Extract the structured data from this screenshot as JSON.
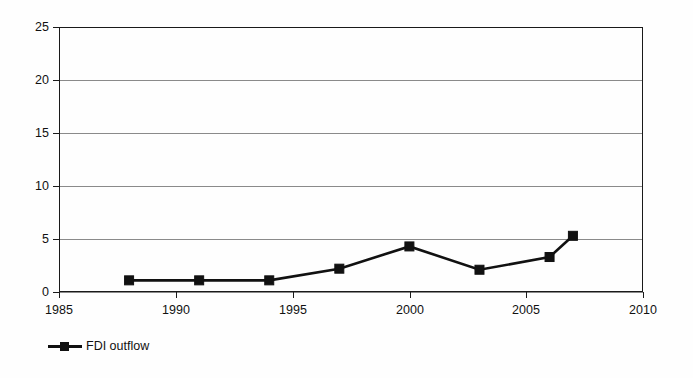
{
  "chart_data": {
    "type": "line",
    "title": "",
    "subtitle": "",
    "xlabel": "",
    "ylabel": "",
    "x": [
      1988,
      1991,
      1994,
      1997,
      2000,
      2003,
      2006,
      2007
    ],
    "values": [
      1.1,
      1.1,
      1.1,
      2.2,
      4.3,
      2.1,
      3.3,
      5.3
    ],
    "series": [
      {
        "name": "FDI outflow",
        "x": [
          1988,
          1991,
          1994,
          1997,
          2000,
          2003,
          2006,
          2007
        ],
        "values": [
          1.1,
          1.1,
          1.1,
          2.2,
          4.3,
          2.1,
          3.3,
          5.3
        ],
        "color": "#111111",
        "marker": "square"
      }
    ],
    "xlim": [
      1985,
      2010
    ],
    "ylim": [
      0,
      25
    ],
    "xticks": [
      1985,
      1990,
      1995,
      2000,
      2005,
      2010
    ],
    "yticks": [
      0,
      5,
      10,
      15,
      20,
      25
    ],
    "xtick_labels": [
      "1985",
      "1990",
      "1995",
      "2000",
      "2005",
      "2010"
    ],
    "ytick_labels": [
      "0",
      "5",
      "10",
      "15",
      "20",
      "25"
    ],
    "grid": "horizontal",
    "legend_position": "bottom-left",
    "legend": [
      "FDI outflow"
    ],
    "annotations": []
  },
  "legend": {
    "entry_label": "FDI outflow"
  },
  "colors": {
    "series": "#111111",
    "grid": "#8a8a8a",
    "axis": "#1a1a1a",
    "background": "#fefefe"
  }
}
